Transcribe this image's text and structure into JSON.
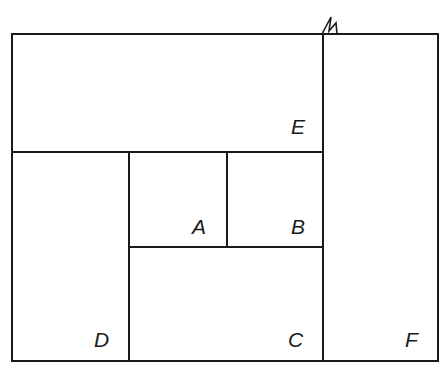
{
  "diagram": {
    "type": "rectangle-partition",
    "regions": [
      {
        "id": "A",
        "label": "A"
      },
      {
        "id": "B",
        "label": "B"
      },
      {
        "id": "C",
        "label": "C"
      },
      {
        "id": "D",
        "label": "D"
      },
      {
        "id": "E",
        "label": "E"
      },
      {
        "id": "F",
        "label": "F"
      }
    ],
    "colors": {
      "line": "#1a1a1a",
      "background": "#ffffff"
    }
  }
}
